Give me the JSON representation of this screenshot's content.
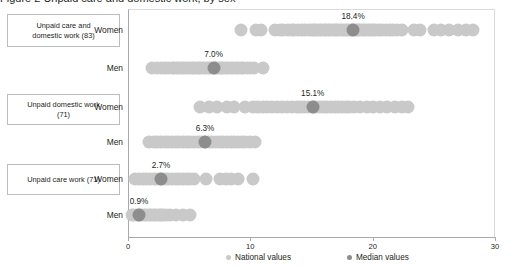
{
  "title_clipped": "Figure 2  Unpaid care and domestic work, by sex",
  "categories": [
    {
      "id": "care-and-domestic",
      "label": "Unpaid care and\ndomestic work (83)",
      "line1": "Unpaid care and",
      "line2": "domestic work (83)"
    },
    {
      "id": "domestic",
      "label": "Unpaid domestic work\n(71)",
      "line1": "Unpaid domestic  work",
      "line2": "(71)"
    },
    {
      "id": "care",
      "label": "Unpaid care work (71)",
      "line1": "Unpaid care work (71)",
      "line2": ""
    }
  ],
  "group_labels": {
    "women": "Women",
    "men": "Men"
  },
  "axis": {
    "ticks": [
      "0",
      "10",
      "20",
      "30"
    ],
    "tick_values": [
      0,
      10,
      20,
      30
    ],
    "min": 0,
    "max": 30
  },
  "legend": [
    {
      "id": "national",
      "label": "National values",
      "color": "#c9c9c9"
    },
    {
      "id": "median",
      "label": "Median values",
      "color": "#8d8d8d"
    }
  ],
  "colors": {
    "national": "#c9c9c9",
    "median": "#8d8d8d",
    "axis": "#a7abb0",
    "box_border": "#b9bdc2",
    "text": "#231f20"
  },
  "median_labels": [
    "18.4%",
    "7.0%",
    "15.1%",
    "6.3%",
    "2.7%",
    "0.9%"
  ],
  "chart_data": {
    "type": "scatter",
    "title": "Unpaid care and domestic work, by sex",
    "xlabel": "",
    "ylabel": "",
    "xlim": [
      0,
      30
    ],
    "grid": false,
    "legend_position": "bottom",
    "series": [
      {
        "name": "National values",
        "color": "#c9c9c9",
        "marker": "circle"
      },
      {
        "name": "Median values",
        "color": "#8d8d8d",
        "marker": "circle"
      }
    ],
    "rows": [
      {
        "category": "Unpaid care and domestic work (83)",
        "group": "Women",
        "median": 18.4,
        "median_label": "18.4%",
        "n": 83,
        "values": [
          9.2,
          10.5,
          10.9,
          12.0,
          12.4,
          12.7,
          13.1,
          13.4,
          13.6,
          13.9,
          14.2,
          14.5,
          14.8,
          15.0,
          15.2,
          15.4,
          15.6,
          15.8,
          16.0,
          16.2,
          16.4,
          16.6,
          16.8,
          17.0,
          17.2,
          17.4,
          17.6,
          17.8,
          18.0,
          18.2,
          18.4,
          18.6,
          18.8,
          19.0,
          19.2,
          19.4,
          19.6,
          19.8,
          20.0,
          20.2,
          20.5,
          20.8,
          21.1,
          21.4,
          21.7,
          22.0,
          22.4,
          23.4,
          23.9,
          25.0,
          25.6,
          26.2,
          27.0,
          27.6,
          28.2
        ]
      },
      {
        "category": "Unpaid care and domestic work (83)",
        "group": "Men",
        "median": 7.0,
        "median_label": "7.0%",
        "n": 83,
        "values": [
          2.0,
          2.4,
          2.7,
          3.0,
          3.3,
          3.6,
          3.8,
          4.0,
          4.2,
          4.4,
          4.6,
          4.8,
          5.0,
          5.2,
          5.4,
          5.6,
          5.8,
          6.0,
          6.2,
          6.4,
          6.6,
          6.8,
          7.0,
          7.2,
          7.4,
          7.6,
          7.8,
          8.0,
          8.2,
          8.4,
          8.6,
          8.8,
          9.0,
          9.2,
          9.4,
          9.7,
          10.0,
          10.3,
          11.0
        ]
      },
      {
        "category": "Unpaid domestic work (71)",
        "group": "Women",
        "median": 15.1,
        "median_label": "15.1%",
        "n": 71,
        "values": [
          5.9,
          6.6,
          7.3,
          8.1,
          8.7,
          9.6,
          10.2,
          10.6,
          11.0,
          11.4,
          11.8,
          12.2,
          12.6,
          13.0,
          13.4,
          13.8,
          14.1,
          14.4,
          14.7,
          15.1,
          15.4,
          15.7,
          16.0,
          16.3,
          16.6,
          16.9,
          17.2,
          17.5,
          17.8,
          18.1,
          18.5,
          19.0,
          19.5,
          20.0,
          20.6,
          21.2,
          21.8,
          22.4,
          22.9
        ]
      },
      {
        "category": "Unpaid domestic work (71)",
        "group": "Men",
        "median": 6.3,
        "median_label": "6.3%",
        "n": 71,
        "values": [
          1.7,
          2.1,
          2.4,
          2.7,
          3.0,
          3.3,
          3.6,
          3.9,
          4.2,
          4.5,
          4.8,
          5.1,
          5.4,
          5.7,
          6.0,
          6.3,
          6.6,
          6.9,
          7.2,
          7.5,
          7.8,
          8.1,
          8.4,
          8.7,
          9.0,
          9.3,
          9.6,
          10.0,
          10.4
        ]
      },
      {
        "category": "Unpaid care work (71)",
        "group": "Women",
        "median": 2.7,
        "median_label": "2.7%",
        "n": 71,
        "values": [
          0.6,
          0.9,
          1.2,
          1.5,
          1.8,
          2.1,
          2.4,
          2.7,
          3.0,
          3.3,
          3.6,
          3.9,
          4.2,
          4.5,
          4.8,
          5.1,
          5.4,
          6.4,
          7.5,
          8.0,
          8.4,
          9.0,
          10.2
        ]
      },
      {
        "category": "Unpaid care work (71)",
        "group": "Men",
        "median": 0.9,
        "median_label": "0.9%",
        "n": 71,
        "values": [
          0.3,
          0.5,
          0.7,
          0.9,
          1.1,
          1.3,
          1.5,
          1.7,
          1.9,
          2.1,
          2.3,
          2.5,
          2.7,
          2.9,
          3.1,
          3.4,
          3.9,
          4.5,
          5.1
        ]
      }
    ]
  }
}
